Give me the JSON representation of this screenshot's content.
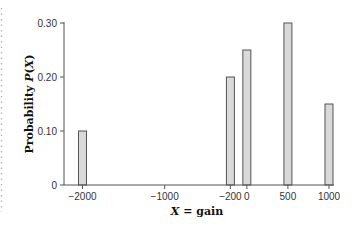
{
  "chart_data": {
    "type": "bar",
    "title": "",
    "xlabel": "X = gain",
    "ylabel": "Probability P(X)",
    "x": [
      -2000,
      -200,
      0,
      500,
      1000
    ],
    "values": [
      0.1,
      0.2,
      0.25,
      0.3,
      0.15
    ],
    "xticks": [
      -2000,
      -1000,
      -200,
      0,
      500,
      1000
    ],
    "xtick_labels": [
      "−2000",
      "−1000",
      "−200",
      "0",
      "500",
      "1000"
    ],
    "yticks": [
      0,
      0.1,
      0.2,
      0.3
    ],
    "ytick_labels": [
      "0",
      "0.10",
      "0.20",
      "0.30"
    ],
    "xlim": [
      -2000,
      1000
    ],
    "ylim": [
      0,
      0.3
    ],
    "grid": false,
    "legend": null
  },
  "colors": {
    "bar_fill": "#d9d9d9",
    "bar_stroke": "#555555",
    "axis": "#555555",
    "left_dots": "#bbbbbb"
  }
}
